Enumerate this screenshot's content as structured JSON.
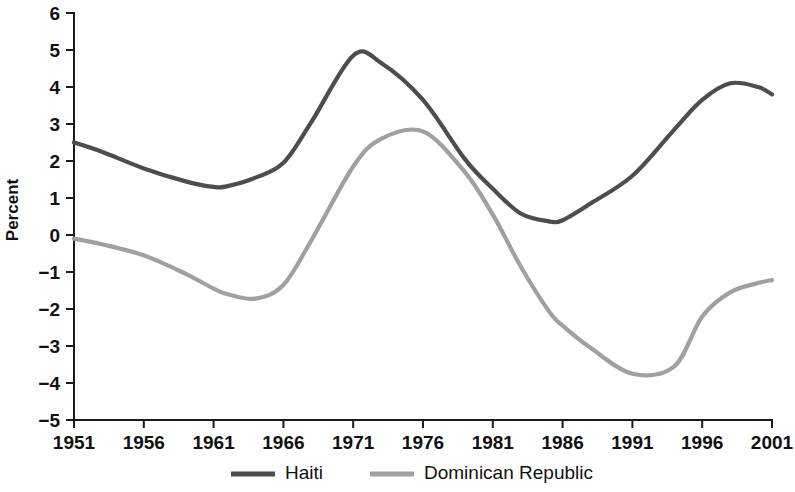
{
  "chart_data": {
    "type": "line",
    "title": "",
    "xlabel": "",
    "ylabel": "Percent",
    "xlim": [
      1951,
      2001
    ],
    "ylim": [
      -5,
      6
    ],
    "grid": false,
    "legend_position": "bottom-center",
    "x_ticks": [
      "1951",
      "1956",
      "1961",
      "1966",
      "1971",
      "1976",
      "1981",
      "1986",
      "1991",
      "1996",
      "2001"
    ],
    "y_ticks": [
      "6",
      "5",
      "4",
      "3",
      "2",
      "1",
      "0",
      "−1",
      "−2",
      "−3",
      "−4",
      "−5"
    ],
    "x": [
      1951,
      1953,
      1956,
      1959,
      1961,
      1962,
      1964,
      1966,
      1968,
      1971,
      1973,
      1976,
      1979,
      1981,
      1983,
      1985,
      1986,
      1988,
      1991,
      1994,
      1996,
      1998,
      2000,
      2001
    ],
    "series": [
      {
        "name": "Haiti",
        "color": "#4d4d4d",
        "values": [
          2.5,
          2.25,
          1.8,
          1.45,
          1.3,
          1.32,
          1.55,
          1.95,
          3.05,
          4.85,
          4.65,
          3.65,
          2.05,
          1.25,
          0.58,
          0.37,
          0.4,
          0.85,
          1.6,
          2.85,
          3.65,
          4.1,
          4.0,
          3.8
        ]
      },
      {
        "name": "Dominican Republic",
        "color": "#a0a0a0",
        "values": [
          -0.1,
          -0.25,
          -0.55,
          -1.05,
          -1.45,
          -1.6,
          -1.72,
          -1.35,
          -0.15,
          1.85,
          2.6,
          2.8,
          1.7,
          0.55,
          -0.85,
          -2.05,
          -2.45,
          -3.05,
          -3.75,
          -3.55,
          -2.2,
          -1.55,
          -1.3,
          -1.22
        ]
      }
    ],
    "annotations": []
  },
  "legend": {
    "items": [
      {
        "label": "Haiti",
        "color": "#4d4d4d"
      },
      {
        "label": "Dominican Republic",
        "color": "#a0a0a0"
      }
    ]
  }
}
